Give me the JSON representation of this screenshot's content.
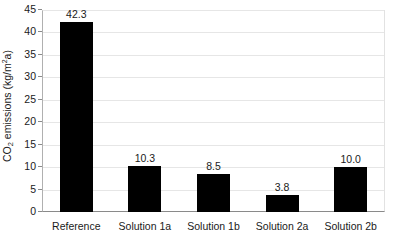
{
  "chart_data": {
    "type": "bar",
    "title": "",
    "xlabel": "",
    "ylabel": "CO2 emissions (kg/m²a)",
    "ylabel_parts": {
      "prefix": "CO",
      "subscript": "2",
      "middle": " emissions (kg/m",
      "superscript": "2",
      "suffix": "a)"
    },
    "categories": [
      "Reference",
      "Solution 1a",
      "Solution 1b",
      "Solution 2a",
      "Solution 2b"
    ],
    "values": [
      42.3,
      10.3,
      8.5,
      3.8,
      10.0
    ],
    "value_labels": [
      "42.3",
      "10.3",
      "8.5",
      "3.8",
      "10.0"
    ],
    "ylim": [
      0,
      45
    ],
    "ytick_step": 5,
    "ytick_labels": [
      "45",
      "40",
      "35",
      "30",
      "25",
      "20",
      "15",
      "10",
      "5",
      "0"
    ],
    "ytick_values": [
      45,
      40,
      35,
      30,
      25,
      20,
      15,
      10,
      5,
      0
    ],
    "grid": true,
    "legend": false,
    "legend_position": "none",
    "bar_color": "#000000",
    "gridline_color": "#e6e6e6",
    "axis_color": "#8a8a8a",
    "background_color": "#ffffff",
    "text_color": "#1a1a1a"
  }
}
